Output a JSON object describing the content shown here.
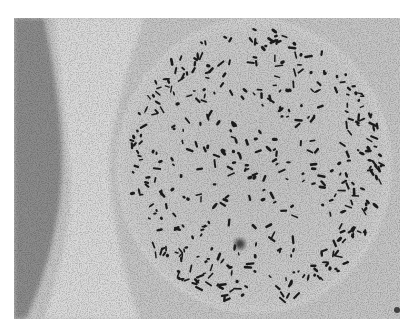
{
  "figure": {
    "caption_visible_text": "",
    "colors": {
      "background_gray": "#c9c9c9",
      "circle_fill": "#cdcdcd",
      "left_band": "#8f8f8f",
      "light_band": "#dcdcdc",
      "particle": "#1e1e1e",
      "rim_halo": "#e6e6e6"
    },
    "circle": {
      "cx": 240,
      "cy": 148,
      "rx": 132,
      "ry": 142
    },
    "particle_count": 420,
    "dark_spot": {
      "cx": 226,
      "cy": 226,
      "r": 5
    }
  }
}
